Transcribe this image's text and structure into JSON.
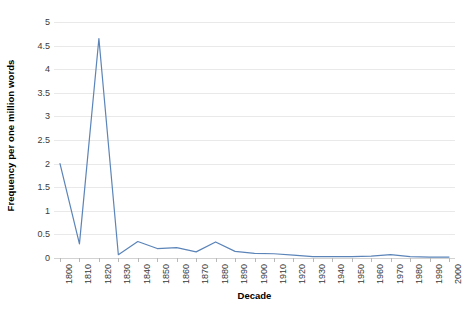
{
  "chart_data": {
    "type": "line",
    "title": "",
    "xlabel": "Decade",
    "ylabel": "Frequency per one million words",
    "xlim": [
      1800,
      2000
    ],
    "ylim": [
      0,
      5
    ],
    "grid": true,
    "legend": false,
    "legend_position": "none",
    "line_color": "#5b84b8",
    "gridline_color": "#e9e9e9",
    "background_color": "#ffffff",
    "x_tick_labels": [
      "1800",
      "1810",
      "1820",
      "1830",
      "1840",
      "1850",
      "1860",
      "1870",
      "1880",
      "1890",
      "1900",
      "1910",
      "1920",
      "1930",
      "1940",
      "1950",
      "1960",
      "1970",
      "1980",
      "1990",
      "2000"
    ],
    "y_tick_labels": [
      "0",
      "0.5",
      "1",
      "1.5",
      "2",
      "2.5",
      "3",
      "3.5",
      "4",
      "4.5",
      "5"
    ],
    "y_ticks": [
      0,
      0.5,
      1,
      1.5,
      2,
      2.5,
      3,
      3.5,
      4,
      4.5,
      5
    ],
    "categories": [
      1800,
      1810,
      1820,
      1830,
      1840,
      1850,
      1860,
      1870,
      1880,
      1890,
      1900,
      1910,
      1920,
      1930,
      1940,
      1950,
      1960,
      1970,
      1980,
      1990,
      2000
    ],
    "values": [
      2.0,
      0.3,
      4.65,
      0.07,
      0.35,
      0.2,
      0.22,
      0.13,
      0.34,
      0.14,
      0.1,
      0.09,
      0.06,
      0.03,
      0.03,
      0.03,
      0.04,
      0.07,
      0.03,
      0.02,
      0.02
    ],
    "series": [
      {
        "name": "Frequency",
        "color": "#5b84b8",
        "values": [
          2.0,
          0.3,
          4.65,
          0.07,
          0.35,
          0.2,
          0.22,
          0.13,
          0.34,
          0.14,
          0.1,
          0.09,
          0.06,
          0.03,
          0.03,
          0.03,
          0.04,
          0.07,
          0.03,
          0.02,
          0.02
        ]
      }
    ]
  },
  "axes": {
    "y_title": "Frequency per one million words",
    "x_title": "Decade"
  }
}
